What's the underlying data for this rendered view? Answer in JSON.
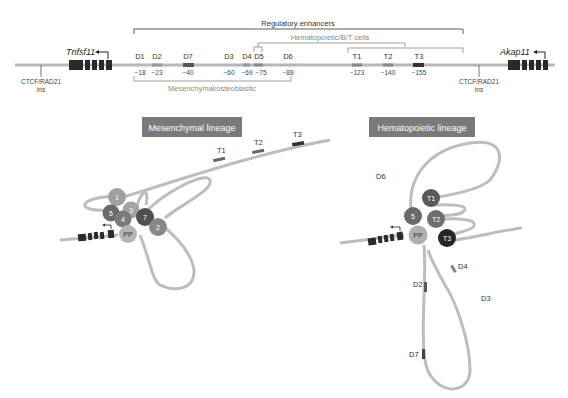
{
  "top_map": {
    "left_gene": "Tnfsf11",
    "right_gene": "Akap11",
    "left_ctcf": {
      "line1": "CTCF/RAD21",
      "line2": "ins"
    },
    "right_ctcf": {
      "line1": "CTCF/RAD21",
      "line2": "ins"
    },
    "bracket_regulatory": "Regulatory enhancers",
    "bracket_hematopoietic": "Hematopoietic/B/T cells",
    "bracket_mesenchymal": "Mesenchymal/osteoblastic",
    "enhancers": [
      {
        "name": "D1",
        "pos": "−18"
      },
      {
        "name": "D2",
        "pos": "−23"
      },
      {
        "name": "D7",
        "pos": "−40"
      },
      {
        "name": "D3",
        "pos": "−60"
      },
      {
        "name": "D4",
        "pos": "−69"
      },
      {
        "name": "D5",
        "pos": "−75"
      },
      {
        "name": "D6",
        "pos": "−88"
      },
      {
        "name": "T1",
        "pos": "−123"
      },
      {
        "name": "T2",
        "pos": "−140"
      },
      {
        "name": "T3",
        "pos": "−155"
      }
    ]
  },
  "mesenchymal": {
    "title": "Mesenchymal lineage",
    "balls": [
      "1",
      "5",
      "3",
      "4",
      "7",
      "2",
      "PP"
    ],
    "loop_labels": [
      "T1",
      "T2",
      "T3"
    ]
  },
  "hematopoietic": {
    "title": "Hematopoietic lineage",
    "balls": [
      "T1",
      "5",
      "T2",
      "PP",
      "T3"
    ],
    "loop_labels": [
      "D6",
      "D4",
      "D2",
      "D3",
      "D7"
    ]
  },
  "colors": {
    "chromatin": "#bdbdbd",
    "title_box": "#7a7a7a",
    "gene_block": "#2a2a2a",
    "ball_light": "#a8a8a8",
    "ball_mid": "#7d7d7d",
    "ball_dark": "#4a4a4a",
    "ball_black": "#262626"
  }
}
